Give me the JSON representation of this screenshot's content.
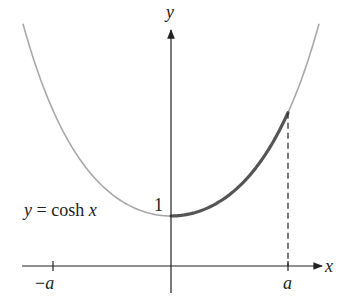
{
  "figure": {
    "curve_label": "y = cosh x",
    "curve_label_parts": {
      "y": "y",
      "eq": " = cosh ",
      "x": "x"
    },
    "y_intercept_label": "1",
    "x_axis_label": "x",
    "y_axis_label": "y",
    "tick_labels": {
      "neg_a": "−a",
      "pos_a": "a"
    },
    "colors": {
      "axis": "#222222",
      "curve_thin": "#a8a8a8",
      "curve_thick": "#555555",
      "dashed": "#222222"
    }
  },
  "geometry": {
    "origin_px": [
      171,
      266
    ],
    "unit_y_px": 50,
    "unit_x_px": 65.5,
    "x_range": [
      -2.26,
      2.26
    ],
    "a": 1.786,
    "highlight_range": [
      0,
      1.786
    ]
  }
}
